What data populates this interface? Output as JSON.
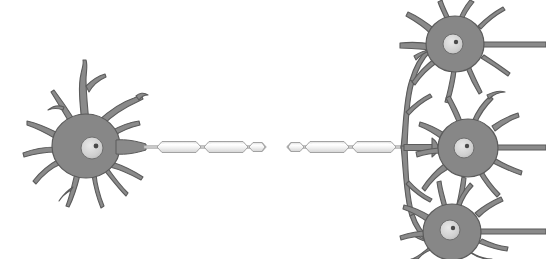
{
  "figure": {
    "width": 546,
    "height": 259,
    "background_color": "#ffffff"
  },
  "palette": {
    "soma_fill": "#878787",
    "soma_stroke": "#5b5b5b",
    "process_fill": "#8a8a8a",
    "process_stroke": "#5b5b5b",
    "nucleus_fill": "#d2d2d2",
    "nucleus_stroke": "#6e6e6e",
    "nucleolus_fill": "#4a4a4a",
    "myelin_fill": "#eeeeee",
    "myelin_highlight": "#ffffff",
    "myelin_stroke": "#9a9a9a",
    "axon_core": "#c9c9c9",
    "axon_stroke": "#8d8d8d",
    "background": "#ffffff"
  },
  "cells": [
    {
      "id": "presynaptic-neuron",
      "role": "sending neuron",
      "label": "presynaptic neuron",
      "soma_center": [
        86,
        146
      ],
      "soma_radius_x": 34,
      "soma_radius_y": 32,
      "nucleus_center": [
        92,
        148
      ],
      "nucleus_radius": 11,
      "nucleolus_offset": [
        4,
        -2
      ],
      "dendrite_count": 13
    },
    {
      "id": "postsynaptic-neuron-top",
      "role": "receiving neuron",
      "label": "postsynaptic neuron (top)",
      "soma_center": [
        455,
        44
      ],
      "soma_radius_x": 29,
      "soma_radius_y": 28,
      "nucleus_center": [
        453,
        44
      ],
      "nucleus_radius": 10,
      "nucleolus_offset": [
        3,
        -2
      ],
      "dendrite_count": 10
    },
    {
      "id": "postsynaptic-neuron-middle",
      "role": "receiving neuron",
      "label": "postsynaptic neuron (middle)",
      "soma_center": [
        468,
        148
      ],
      "soma_radius_x": 30,
      "soma_radius_y": 29,
      "nucleus_center": [
        464,
        148
      ],
      "nucleus_radius": 10,
      "nucleolus_offset": [
        3,
        -2
      ],
      "dendrite_count": 11
    },
    {
      "id": "postsynaptic-neuron-bottom",
      "role": "receiving neuron",
      "label": "postsynaptic neuron (bottom)",
      "soma_center": [
        452,
        232
      ],
      "soma_radius_x": 29,
      "soma_radius_y": 28,
      "nucleus_center": [
        450,
        230
      ],
      "nucleus_radius": 10,
      "nucleolus_offset": [
        3,
        -2
      ],
      "dendrite_count": 10
    }
  ],
  "axon": {
    "label": "myelinated axon",
    "origin": [
      120,
      147
    ],
    "terminus": [
      404,
      147
    ],
    "baseline_y": 147,
    "thickness": 3,
    "has_break": true,
    "break_range": [
      262,
      290
    ],
    "myelin_segments": [
      {
        "x": 157,
        "width": 44,
        "height": 11
      },
      {
        "x": 204,
        "width": 44,
        "height": 11
      },
      {
        "x": 251,
        "width": 14,
        "height": 9
      },
      {
        "x": 288,
        "width": 14,
        "height": 9
      },
      {
        "x": 305,
        "width": 44,
        "height": 11
      },
      {
        "x": 352,
        "width": 44,
        "height": 11
      }
    ],
    "nodes_of_ranvier": [
      154,
      202,
      249,
      303,
      350,
      397
    ]
  },
  "terminal_branches": {
    "label": "axon terminal branches",
    "junction": [
      404,
      147
    ],
    "targets": [
      "postsynaptic-neuron-top",
      "postsynaptic-neuron-middle",
      "postsynaptic-neuron-bottom"
    ],
    "branch_count": 3,
    "bouton_style": "flared terminal"
  },
  "annotations": []
}
